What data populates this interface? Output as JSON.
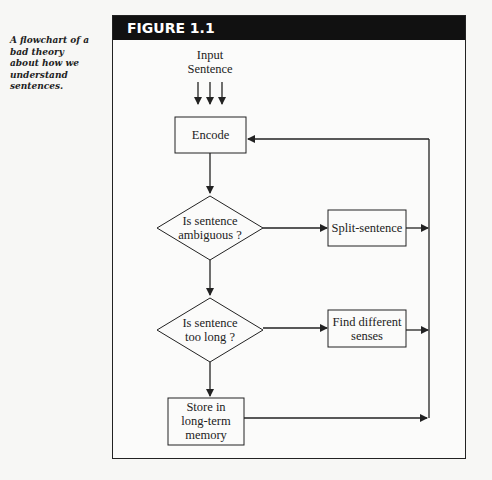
{
  "caption": "A flowchart of a bad theory about how we understand sentences.",
  "figure": {
    "title": "FIGURE 1.1"
  },
  "flowchart": {
    "input_label_line1": "Input",
    "input_label_line2": "Sentence",
    "nodes": {
      "encode": "Encode",
      "ambiguous_line1": "Is sentence",
      "ambiguous_line2": "ambiguous ?",
      "split": "Split-sentence",
      "too_long_line1": "Is sentence",
      "too_long_line2": "too long ?",
      "find_line1": "Find different",
      "find_line2": "senses",
      "store_line1": "Store in",
      "store_line2": "long-term",
      "store_line3": "memory"
    },
    "edges": [
      {
        "from": "input",
        "to": "encode",
        "count": 3
      },
      {
        "from": "encode",
        "to": "ambiguous"
      },
      {
        "from": "ambiguous",
        "to": "split"
      },
      {
        "from": "ambiguous",
        "to": "too_long"
      },
      {
        "from": "too_long",
        "to": "find"
      },
      {
        "from": "too_long",
        "to": "store"
      },
      {
        "from": "split",
        "to": "encode"
      },
      {
        "from": "find",
        "to": "encode"
      },
      {
        "from": "store",
        "to": "encode"
      }
    ]
  },
  "colors": {
    "header_bg": "#111111",
    "header_text": "#ffffff",
    "line": "#222222"
  }
}
